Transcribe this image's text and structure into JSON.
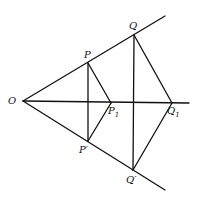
{
  "diagram": {
    "labels": {
      "O": "O",
      "P": "P",
      "Q": "Q",
      "P1_base": "P",
      "P1_sub": "1",
      "Q1_base": "Q",
      "Q1_sub": "1",
      "P_prime": "P′",
      "Q_prime": "Q′"
    },
    "points": {
      "O": [
        23,
        101
      ],
      "P": [
        88,
        63
      ],
      "Q": [
        134,
        35
      ],
      "P1": [
        111,
        103
      ],
      "Q1": [
        172,
        103
      ],
      "P_prime": [
        88,
        141
      ],
      "Q_prime": [
        133,
        170
      ]
    },
    "color": "#111111"
  }
}
